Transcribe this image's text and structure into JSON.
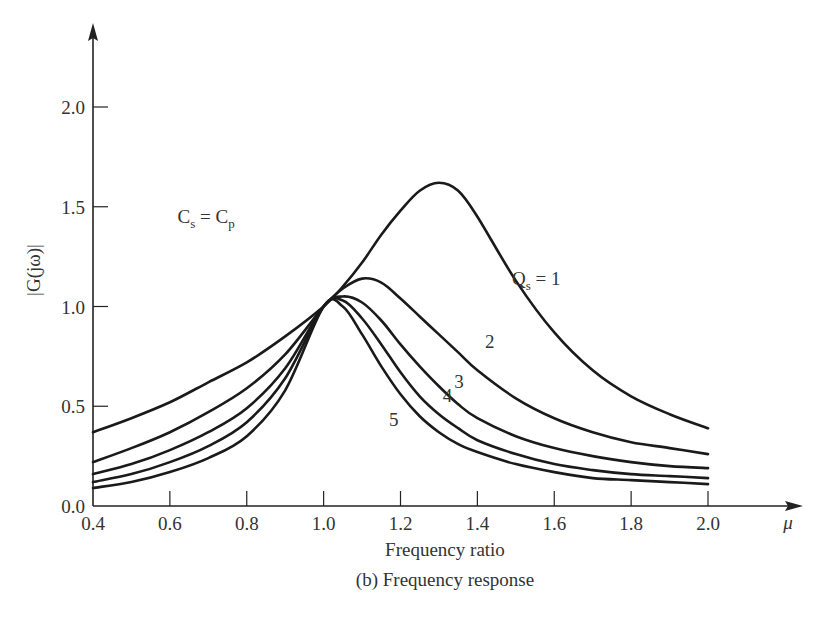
{
  "chart_data": {
    "type": "line",
    "title": "",
    "caption": "(b) Frequency response",
    "xlabel": "Frequency ratio",
    "x_axis_symbol": "μ",
    "ylabel": "|G(jω)|",
    "xlim": [
      0.4,
      2.0
    ],
    "ylim": [
      0.0,
      2.0
    ],
    "x_ticks": [
      0.4,
      0.6,
      0.8,
      1.0,
      1.2,
      1.4,
      1.6,
      1.8,
      2.0
    ],
    "x_tick_labels": [
      "0.4",
      "0.6",
      "0.8",
      "1.0",
      "1.2",
      "1.4",
      "1.6",
      "1.8",
      "2.0"
    ],
    "y_ticks": [
      0.0,
      0.5,
      1.0,
      1.5,
      2.0
    ],
    "y_tick_labels": [
      "0.0",
      "0.5",
      "1.0",
      "1.5",
      "2.0"
    ],
    "grid": false,
    "legend": "inline curve labels",
    "annotations": [
      {
        "text": "C_s = C_p",
        "main": "C",
        "sub1": "s",
        "mid": " = C",
        "sub2": "p",
        "x": 0.62,
        "y": 1.42
      },
      {
        "text": "Q_s = 1",
        "main": "Q",
        "sub1": "s",
        "mid": " = 1",
        "x": 1.49,
        "y": 1.11
      },
      {
        "text": "2",
        "x": 1.42,
        "y": 0.79
      },
      {
        "text": "3",
        "x": 1.34,
        "y": 0.59
      },
      {
        "text": "4",
        "x": 1.31,
        "y": 0.52
      },
      {
        "text": "5",
        "x": 1.17,
        "y": 0.4
      }
    ],
    "x": [
      0.4,
      0.5,
      0.6,
      0.7,
      0.8,
      0.9,
      1.0,
      1.05,
      1.1,
      1.15,
      1.2,
      1.25,
      1.3,
      1.35,
      1.4,
      1.5,
      1.6,
      1.7,
      1.8,
      1.9,
      2.0
    ],
    "series": [
      {
        "name": "Q_s = 1",
        "label": "Q_s = 1",
        "values": [
          0.37,
          0.44,
          0.52,
          0.62,
          0.72,
          0.85,
          1.0,
          1.1,
          1.22,
          1.36,
          1.48,
          1.58,
          1.62,
          1.58,
          1.45,
          1.13,
          0.87,
          0.68,
          0.55,
          0.46,
          0.39
        ]
      },
      {
        "name": "Q_s = 2",
        "label": "2",
        "values": [
          0.22,
          0.29,
          0.37,
          0.47,
          0.59,
          0.76,
          1.0,
          1.09,
          1.14,
          1.12,
          1.04,
          0.95,
          0.86,
          0.77,
          0.68,
          0.54,
          0.44,
          0.37,
          0.32,
          0.29,
          0.26
        ]
      },
      {
        "name": "Q_s = 3",
        "label": "3",
        "values": [
          0.16,
          0.21,
          0.28,
          0.37,
          0.49,
          0.69,
          1.0,
          1.05,
          1.02,
          0.93,
          0.81,
          0.7,
          0.6,
          0.51,
          0.44,
          0.35,
          0.29,
          0.25,
          0.22,
          0.2,
          0.19
        ]
      },
      {
        "name": "Q_s = 4",
        "label": "4",
        "values": [
          0.12,
          0.16,
          0.22,
          0.3,
          0.42,
          0.64,
          1.0,
          1.03,
          0.94,
          0.81,
          0.67,
          0.55,
          0.46,
          0.39,
          0.33,
          0.26,
          0.21,
          0.18,
          0.16,
          0.15,
          0.14
        ]
      },
      {
        "name": "Q_s = 5",
        "label": "5",
        "values": [
          0.09,
          0.12,
          0.17,
          0.24,
          0.35,
          0.58,
          1.0,
          1.0,
          0.86,
          0.7,
          0.56,
          0.45,
          0.37,
          0.31,
          0.27,
          0.21,
          0.17,
          0.14,
          0.13,
          0.12,
          0.11
        ]
      }
    ],
    "colors": {
      "line": "#1a1a1a",
      "axis": "#222222",
      "text": "#333333",
      "background": "#ffffff"
    }
  }
}
